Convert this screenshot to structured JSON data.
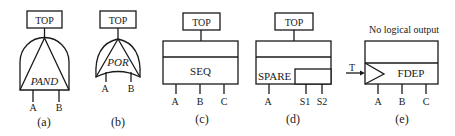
{
  "diagram": {
    "gates": [
      {
        "id": "a",
        "type": "PAND",
        "label": "PAND",
        "top_label": "TOP",
        "inputs": [
          "A",
          "B"
        ],
        "caption": "(a)"
      },
      {
        "id": "b",
        "type": "POR",
        "label": "POR",
        "top_label": "TOP",
        "inputs": [
          "A",
          "B"
        ],
        "caption": "(b)"
      },
      {
        "id": "c",
        "type": "SEQ",
        "label": "SEQ",
        "top_label": "TOP",
        "inputs": [
          "A",
          "B",
          "C"
        ],
        "caption": "(c)"
      },
      {
        "id": "d",
        "type": "SPARE",
        "label": "SPARE",
        "top_label": "TOP",
        "inputs": [
          "A",
          "S1",
          "S2"
        ],
        "caption": "(d)"
      },
      {
        "id": "e",
        "type": "FDEP",
        "label": "FDEP",
        "top_label": "No logical output",
        "trigger": "T",
        "inputs": [
          "A",
          "B",
          "C"
        ],
        "caption": "(e)"
      }
    ]
  }
}
